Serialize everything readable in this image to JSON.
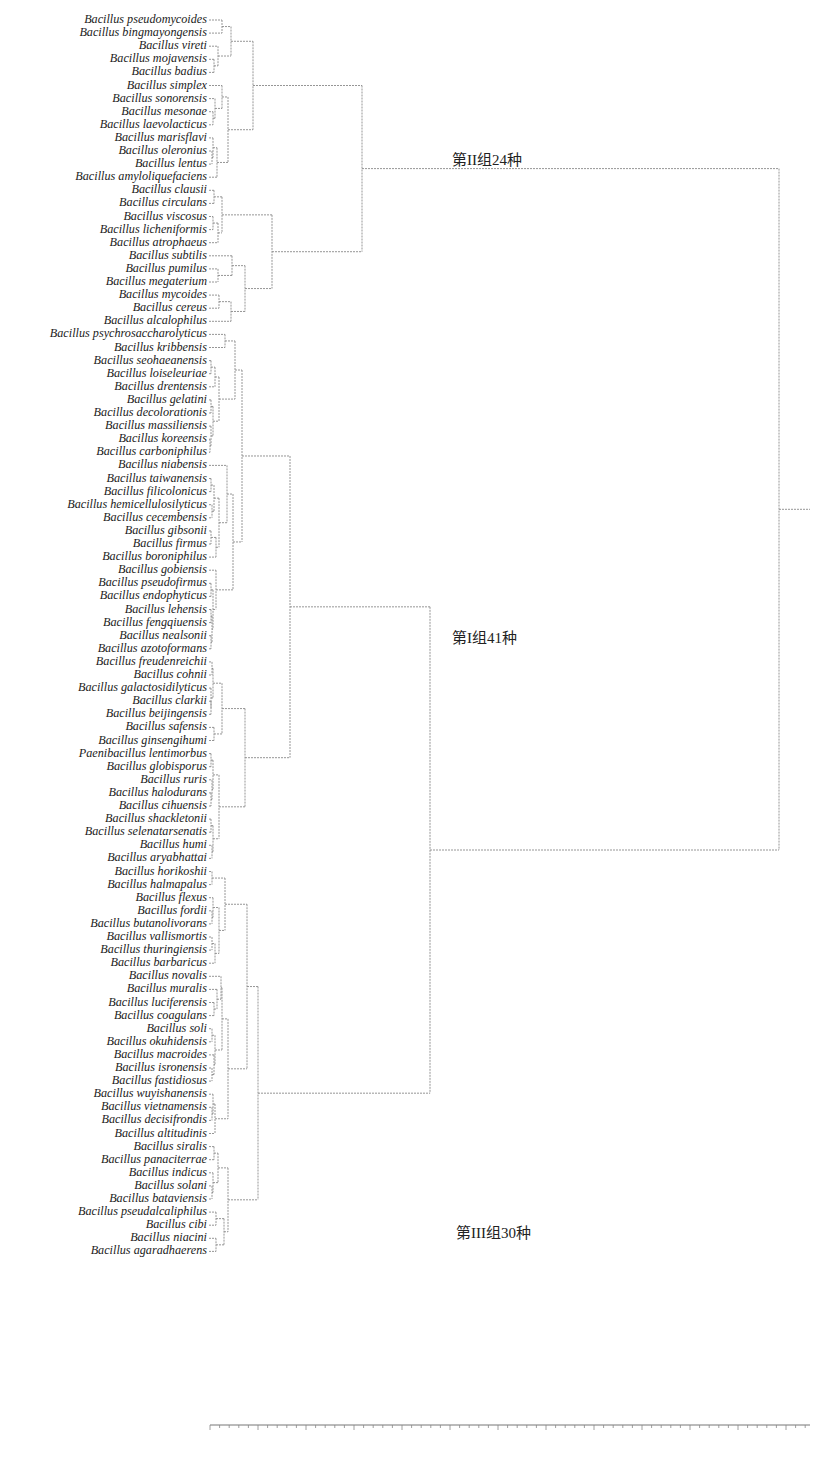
{
  "chart_data": {
    "type": "dendrogram",
    "orientation": "leaves-left",
    "title": "",
    "leaf_y_start": 20,
    "leaf_spacing": 13.1,
    "groups": [
      {
        "id": "II",
        "label": "第II组24种",
        "count": 24,
        "leaf_range": [
          0,
          23
        ]
      },
      {
        "id": "I",
        "label": "第I组41种",
        "count": 41,
        "leaf_range": [
          24,
          64
        ]
      },
      {
        "id": "III",
        "label": "第III组30种",
        "count": 30,
        "leaf_range": [
          65,
          94
        ]
      }
    ],
    "leaves": [
      "Bacillus pseudomycoides",
      "Bacillus bingmayongensis",
      "Bacillus vireti",
      "Bacillus mojavensis",
      "Bacillus badius",
      "Bacillus simplex",
      "Bacillus sonorensis",
      "Bacillus mesonae",
      "Bacillus laevolacticus",
      "Bacillus marisflavi",
      "Bacillus oleronius",
      "Bacillus lentus",
      "Bacillus amyloliquefaciens",
      "Bacillus clausii",
      "Bacillus circulans",
      "Bacillus viscosus",
      "Bacillus licheniformis",
      "Bacillus atrophaeus",
      "Bacillus subtilis",
      "Bacillus pumilus",
      "Bacillus megaterium",
      "Bacillus mycoides",
      "Bacillus cereus",
      "Bacillus alcalophilus",
      "Bacillus psychrosaccharolyticus",
      "Bacillus kribbensis",
      "Bacillus seohaeanensis",
      "Bacillus loiseleuriae",
      "Bacillus drentensis",
      "Bacillus gelatini",
      "Bacillus decolorationis",
      "Bacillus massiliensis",
      "Bacillus koreensis",
      "Bacillus carboniphilus",
      "Bacillus niabensis",
      "Bacillus taiwanensis",
      "Bacillus filicolonicus",
      "Bacillus hemicellulosilyticus",
      "Bacillus cecembensis",
      "Bacillus gibsonii",
      "Bacillus firmus",
      "Bacillus boroniphilus",
      "Bacillus gobiensis",
      "Bacillus pseudofirmus",
      "Bacillus endophyticus",
      "Bacillus lehensis",
      "Bacillus fengqiuensis",
      "Bacillus nealsonii",
      "Bacillus azotoformans",
      "Bacillus freudenreichii",
      "Bacillus cohnii",
      "Bacillus galactosidilyticus",
      "Bacillus clarkii",
      "Bacillus beijingensis",
      "Bacillus safensis",
      "Bacillus ginsengihumi",
      "Paenibacillus  lentimorbus",
      "Bacillus globisporus",
      "Bacillus ruris",
      "Bacillus halodurans",
      "Bacillus cihuensis",
      "Bacillus shackletonii",
      "Bacillus selenatarsenatis",
      "Bacillus humi",
      "Bacillus aryabhattai",
      "Bacillus horikoshii",
      "Bacillus halmapalus",
      "Bacillus flexus",
      "Bacillus fordii",
      "Bacillus butanolivorans",
      "Bacillus vallismortis",
      "Bacillus thuringiensis",
      "Bacillus barbaricus",
      "Bacillus novalis",
      "Bacillus muralis",
      "Bacillus luciferensis",
      "Bacillus coagulans",
      "Bacillus soli",
      "Bacillus okuhidensis",
      "Bacillus macroides",
      "Bacillus isronensis",
      "Bacillus fastidiosus",
      "Bacillus wuyishanensis",
      "Bacillus vietnamensis",
      "Bacillus decisifrondis",
      "Bacillus altitudinis",
      "Bacillus siralis",
      "Bacillus panaciterrae",
      "Bacillus indicus",
      "Bacillus solani",
      "Bacillus bataviensis",
      "Bacillus pseudalcaliphilus",
      "Bacillus cibi",
      "Bacillus niacini",
      "Bacillus agaradhaerens"
    ],
    "axis": {
      "ticks_visible": true,
      "tick_labels": [],
      "x_range_px": [
        210,
        810
      ],
      "y_px": 1425
    },
    "line_color": "#8a8a8a",
    "line_style": "dashed"
  }
}
